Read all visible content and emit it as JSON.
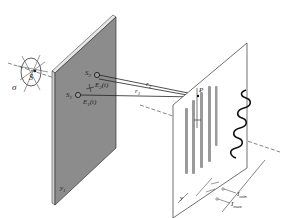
{
  "diagram": {
    "colors": {
      "background": "#ffffff",
      "line": "#2a2a2a",
      "aperture_screen": "#8c8c8c",
      "aperture_edge": "#d8d8d8",
      "fringe": "#9a9a9a",
      "axis": "#555555"
    },
    "source": {
      "label": "S",
      "aperture_label": "σ"
    },
    "aperture_screen": {
      "slit1_label": "S",
      "slit1_sub": "1",
      "slit2_label": "S",
      "slit2_sub": "2",
      "field1_label": "E",
      "field1_sub": "1",
      "field1_arg": "(t)",
      "field2_label": "E",
      "field2_sub": "2",
      "field2_arg": "(t)",
      "axis_label": "y",
      "axis_sub": "1"
    },
    "paths": {
      "r1_label": "r",
      "r1_sub": "1",
      "r2_label": "r",
      "r2_sub": "2"
    },
    "observation_screen": {
      "point_label": "P",
      "axis_label": "y"
    },
    "intensity": {
      "min_label": "I",
      "min_sub": "min",
      "max_label": "I",
      "max_sub": "max"
    }
  }
}
